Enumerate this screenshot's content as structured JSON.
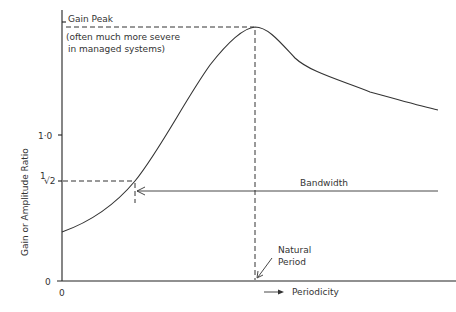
{
  "diagram": {
    "type": "frequency-response-curve",
    "y_axis": {
      "label": "Gain or Amplitude Ratio",
      "ticks": [
        {
          "label": "0",
          "value": 0
        },
        {
          "label": "1/√2",
          "value": 0.707
        },
        {
          "label": "1·0",
          "value": 1.0
        }
      ]
    },
    "x_axis": {
      "origin_label": "0",
      "label": "Periodicity",
      "arrow": "→"
    },
    "annotations": {
      "gain_peak_title": "Gain Peak",
      "gain_peak_note_line1": "(often much more severe",
      "gain_peak_note_line2": "in managed systems)",
      "bandwidth": "Bandwidth",
      "natural_period_line1": "Natural",
      "natural_period_line2": "Period"
    },
    "tick_labels": {
      "one": "1·0",
      "half_root_num": "1",
      "half_root_den": "√2",
      "zero_y": "0",
      "zero_x": "0"
    },
    "colors": {
      "ink": "#333333",
      "background": "#ffffff"
    }
  }
}
